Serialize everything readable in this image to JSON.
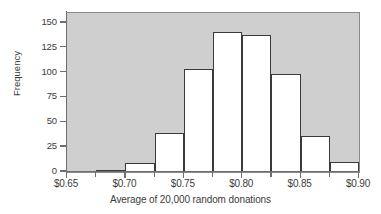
{
  "chart_data": {
    "type": "bar",
    "title": "",
    "subtitle": "",
    "xlabel": "Average of 20,000 random donations",
    "ylabel": "Frequency",
    "xlim": [
      0.65,
      0.9
    ],
    "ylim": [
      0,
      160
    ],
    "grid": false,
    "legend": null,
    "bin_width": 0.025,
    "bin_edges": [
      0.675,
      0.7,
      0.725,
      0.75,
      0.775,
      0.8,
      0.825,
      0.85,
      0.875
    ],
    "categories": [
      "0.675-0.700",
      "0.700-0.725",
      "0.725-0.750",
      "0.750-0.775",
      "0.775-0.800",
      "0.800-0.825",
      "0.825-0.850",
      "0.850-0.875"
    ],
    "values": [
      2,
      9,
      39,
      104,
      141,
      138,
      99,
      36
    ],
    "bars": [
      {
        "x0": 0.675,
        "x1": 0.7,
        "value": 2
      },
      {
        "x0": 0.7,
        "x1": 0.725,
        "value": 9
      },
      {
        "x0": 0.725,
        "x1": 0.75,
        "value": 39
      },
      {
        "x0": 0.75,
        "x1": 0.775,
        "value": 104
      },
      {
        "x0": 0.775,
        "x1": 0.8,
        "value": 141
      },
      {
        "x0": 0.8,
        "x1": 0.825,
        "value": 138
      },
      {
        "x0": 0.825,
        "x1": 0.85,
        "value": 99
      },
      {
        "x0": 0.85,
        "x1": 0.875,
        "value": 36
      },
      {
        "x0": 0.875,
        "x1": 0.9,
        "value": 10
      },
      {
        "x0": 0.9,
        "x1": 0.925,
        "value": 2
      }
    ],
    "y_ticks": [
      0,
      25,
      50,
      75,
      100,
      125,
      150
    ],
    "y_tick_labels": [
      "0",
      "25",
      "50",
      "75",
      "100",
      "125",
      "150"
    ],
    "x_ticks": [
      0.65,
      0.675,
      0.7,
      0.725,
      0.75,
      0.775,
      0.8,
      0.825,
      0.85,
      0.875,
      0.9
    ],
    "x_major_ticks": [
      0.65,
      0.7,
      0.75,
      0.8,
      0.85,
      0.9
    ],
    "x_tick_labels": [
      "$0.65",
      "$0.70",
      "$0.75",
      "$0.80",
      "$0.85",
      "$0.90"
    ],
    "colors": {
      "panel_background": "#cfcfcf",
      "bar_fill": "#ffffff",
      "bar_edge": "#3a3a3a",
      "axis": "#6f6f6f",
      "text": "#3c3c3c",
      "figure_background": "#ffffff"
    }
  }
}
